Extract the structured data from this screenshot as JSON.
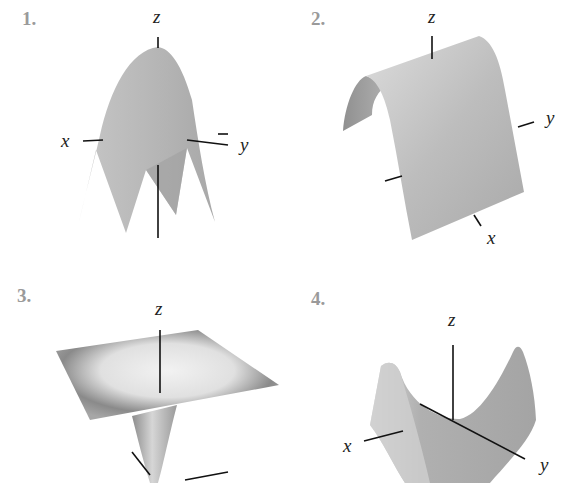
{
  "figures": [
    {
      "number": "1.",
      "surface": "downward paraboloid (cap)",
      "axes": {
        "z": "z",
        "x": "x",
        "y": "y"
      }
    },
    {
      "number": "2.",
      "surface": "parabolic cylinder (arch)",
      "axes": {
        "z": "z",
        "x": "x",
        "y": "y"
      }
    },
    {
      "number": "3.",
      "surface": "funnel / cone dipping below a flat plane",
      "axes": {
        "z": "z"
      }
    },
    {
      "number": "4.",
      "surface": "hyperbolic paraboloid (saddle)",
      "axes": {
        "z": "z",
        "x": "x",
        "y": "y"
      }
    }
  ],
  "colors": {
    "surface_mid": "#b4b4b4",
    "surface_light": "#e6e6e6",
    "surface_dark": "#8c8c8c",
    "axis": "#111111",
    "number": "#9a9a9a"
  }
}
